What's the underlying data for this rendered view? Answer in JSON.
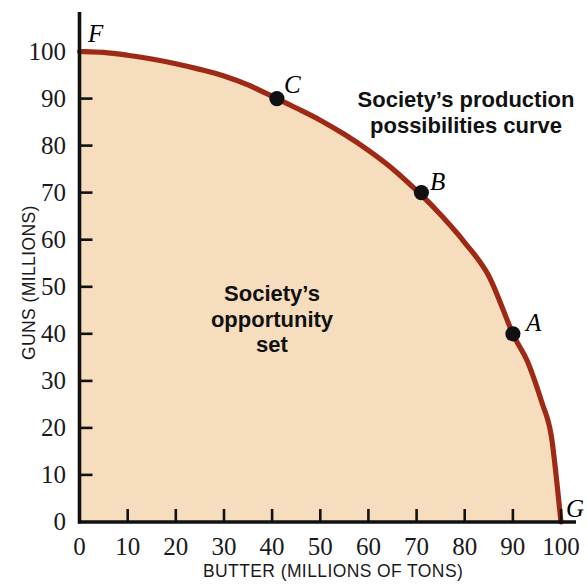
{
  "chart_data": {
    "type": "line",
    "title": "",
    "xlabel": "BUTTER (MILLIONS OF TONS)",
    "ylabel": "GUNS (MILLIONS)",
    "xlim": [
      0,
      104
    ],
    "ylim": [
      0,
      108
    ],
    "xticks": [
      "0",
      "10",
      "20",
      "30",
      "40",
      "50",
      "60",
      "70",
      "80",
      "90",
      "100"
    ],
    "xtick_values": [
      0,
      10,
      20,
      30,
      40,
      50,
      60,
      70,
      80,
      90,
      100
    ],
    "yticks": [
      "0",
      "10",
      "20",
      "30",
      "40",
      "50",
      "60",
      "70",
      "80",
      "90",
      "100"
    ],
    "ytick_values": [
      0,
      10,
      20,
      30,
      40,
      50,
      60,
      70,
      80,
      90,
      100
    ],
    "grid": false,
    "legend": "none",
    "series": [
      {
        "name": "Society's production possibilities curve",
        "color": "#9e2a15",
        "fill_color": "#f6ddbd",
        "x": [
          0,
          5,
          10,
          15,
          20,
          25,
          30,
          35,
          41,
          45,
          50,
          55,
          60,
          65,
          71,
          75,
          80,
          85,
          90,
          93,
          96,
          98,
          100
        ],
        "y": [
          100,
          99.8,
          99.2,
          98.4,
          97.4,
          96.2,
          94.8,
          92.9,
          90,
          88,
          85.4,
          82.4,
          79,
          75.1,
          69.5,
          65.3,
          59.4,
          52.3,
          40,
          34.2,
          25.5,
          18.2,
          0
        ]
      }
    ],
    "points": [
      {
        "label": "A",
        "x": 90,
        "y": 40
      },
      {
        "label": "B",
        "x": 71,
        "y": 70
      },
      {
        "label": "C",
        "x": 41,
        "y": 90
      }
    ],
    "endpoints": [
      {
        "label": "F",
        "x": 0,
        "y": 100
      },
      {
        "label": "G",
        "x": 100,
        "y": 0
      }
    ],
    "annotations": [
      {
        "id": "curve-label",
        "lines": [
          "Society’s production",
          "possibilities curve"
        ]
      },
      {
        "id": "opportunity-set-label",
        "lines": [
          "Society’s",
          "opportunity",
          "set"
        ]
      }
    ],
    "colors": {
      "curve": "#9e2a15",
      "fill": "#f6ddbd",
      "axis": "#111111",
      "point": "#111111",
      "background": "#ffffff"
    }
  },
  "axes": {
    "x_label": "BUTTER (MILLIONS OF TONS)",
    "y_label": "GUNS (MILLIONS)",
    "x_tick_labels": [
      "0",
      "10",
      "20",
      "30",
      "40",
      "50",
      "60",
      "70",
      "80",
      "90",
      "100"
    ],
    "y_tick_labels": [
      "100",
      "90",
      "80",
      "70",
      "60",
      "50",
      "40",
      "30",
      "20",
      "10",
      "0"
    ]
  },
  "labels": {
    "point_a": "A",
    "point_b": "B",
    "point_c": "C",
    "point_f": "F",
    "point_g": "G",
    "curve_line1": "Society’s production",
    "curve_line2": "possibilities curve",
    "set_line1": "Society’s",
    "set_line2": "opportunity",
    "set_line3": "set"
  }
}
